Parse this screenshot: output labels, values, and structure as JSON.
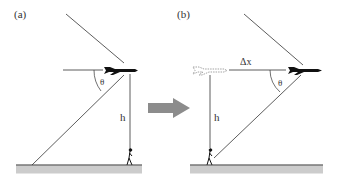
{
  "figure": {
    "panel_a": {
      "label": "(a)",
      "angle_label": "θ",
      "height_label": "h"
    },
    "panel_b": {
      "label": "(b)",
      "angle_label": "θ",
      "height_label": "h",
      "displacement_label": "Δx"
    },
    "transition_arrow": "right-arrow",
    "colors": {
      "line": "#333333",
      "ground": "#cccccc",
      "ground_line": "#333333",
      "arrow": "#8c8c8c",
      "plane": "#111111"
    }
  }
}
